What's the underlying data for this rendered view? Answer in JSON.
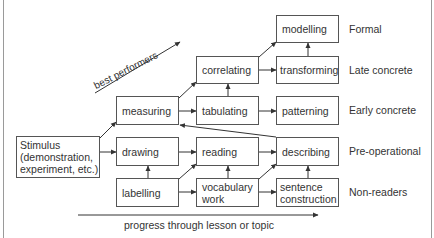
{
  "diagram": {
    "boxes": {
      "modelling": "modelling",
      "correlating": "correlating",
      "transforming": "transforming",
      "measuring": "measuring",
      "tabulating": "tabulating",
      "patterning": "patterning",
      "stimulus_line1": "Stimulus",
      "stimulus_line2": "(demonstration,",
      "stimulus_line3": "experiment, etc.)",
      "drawing": "drawing",
      "reading": "reading",
      "describing": "describing",
      "labelling": "labelling",
      "vocabulary_line1": "vocabulary",
      "vocabulary_line2": "work",
      "sentence_line1": "sentence",
      "sentence_line2": "construction"
    },
    "stages": [
      {
        "label": "Formal"
      },
      {
        "label": "Late concrete"
      },
      {
        "label": "Early concrete"
      },
      {
        "label": "Pre-operational"
      },
      {
        "label": "Non-readers"
      }
    ],
    "best_performers_label": "best performers",
    "progress_label": "progress through lesson or topic",
    "colors": {
      "line": "#333333",
      "box_border": "#555555",
      "frame": "#9a9a9a"
    }
  }
}
